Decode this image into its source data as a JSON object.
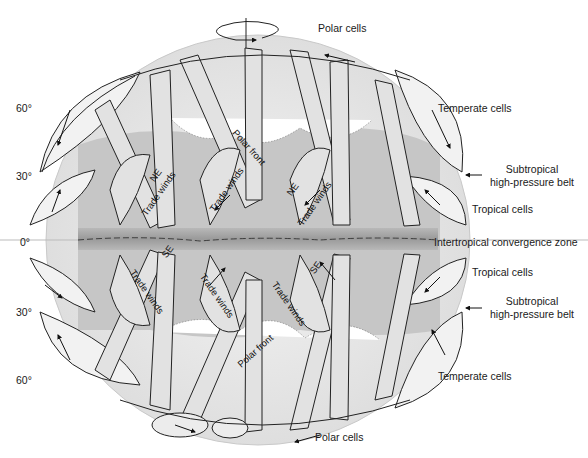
{
  "diagram": {
    "latitude_labels": [
      {
        "label": "60°",
        "hemisphere": "north"
      },
      {
        "label": "30°",
        "hemisphere": "north"
      },
      {
        "label": "0°",
        "hemisphere": "equator"
      },
      {
        "label": "30°",
        "hemisphere": "south"
      },
      {
        "label": "60°",
        "hemisphere": "south"
      }
    ],
    "right_labels": {
      "polar_cells_north": "Polar cells",
      "temperate_cells_north": "Temperate cells",
      "subtropical_north_1": "Subtropical",
      "subtropical_north_2": "high-pressure belt",
      "tropical_cells_north": "Tropical cells",
      "itcz": "Intertropical convergence zone",
      "tropical_cells_south": "Tropical cells",
      "subtropical_south_1": "Subtropical",
      "subtropical_south_2": "high-pressure belt",
      "temperate_cells_south": "Temperate cells",
      "polar_cells_south": "Polar cells"
    },
    "inner_labels": {
      "polar_front_north": "Polar front",
      "ne": "NE",
      "trade_winds": "Trade winds",
      "se": "SE",
      "polar_front_south": "Polar front"
    },
    "icons": [
      "rotation-axis-icon",
      "pointer-arrow-icon",
      "circulation-arrow-icon"
    ],
    "colors": {
      "background": "#ffffff",
      "globe_light": "#ededed",
      "globe_mid": "#c8c8c8",
      "globe_dark": "#9e9e9e",
      "ribbon": "#e4e4e4",
      "outline": "#222222",
      "text": "#1a1a1a"
    }
  }
}
